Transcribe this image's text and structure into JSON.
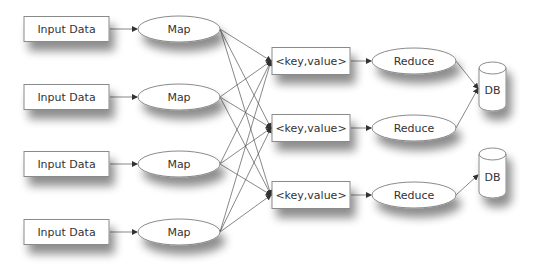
{
  "diagram": {
    "inputs": [
      {
        "label": "Input Data",
        "cy": 29
      },
      {
        "label": "Input Data",
        "cy": 97
      },
      {
        "label": "Input Data",
        "cy": 164
      },
      {
        "label": "Input Data",
        "cy": 232
      }
    ],
    "maps": [
      {
        "label": "Map",
        "cy": 29
      },
      {
        "label": "Map",
        "cy": 97
      },
      {
        "label": "Map",
        "cy": 164
      },
      {
        "label": "Map",
        "cy": 232
      }
    ],
    "kv_pairs": [
      {
        "label": "<key,value>",
        "cy": 61
      },
      {
        "label": "<key,value>",
        "cy": 128
      },
      {
        "label": "<key,value>",
        "cy": 195
      }
    ],
    "reducers": [
      {
        "label": "Reduce",
        "cy": 61
      },
      {
        "label": "Reduce",
        "cy": 128
      },
      {
        "label": "Reduce",
        "cy": 195
      }
    ],
    "databases": [
      {
        "label": "DB",
        "top": 62,
        "bottom": 111
      },
      {
        "label": "DB",
        "top": 148,
        "bottom": 198
      }
    ],
    "reduce_to_db": [
      0,
      0,
      1
    ],
    "colors": {
      "stroke": "#8a8a8a",
      "line": "#555555",
      "fill": "#ffffff",
      "shadow": "#000000"
    }
  }
}
